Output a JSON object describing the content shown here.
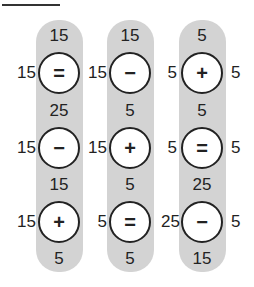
{
  "puzzle": {
    "columns": [
      {
        "rows": [
          {
            "top": "15",
            "left": "15",
            "op": "=",
            "right": "15"
          },
          {
            "top": "25",
            "left": "15",
            "op": "−",
            "right": "15"
          },
          {
            "top": "15",
            "left": "15",
            "op": "+",
            "right": "5"
          }
        ],
        "bottom": "5"
      },
      {
        "rows": [
          {
            "top": "15",
            "left": "15",
            "op": "−",
            "right": "5"
          },
          {
            "top": "5",
            "left": "15",
            "op": "+",
            "right": "5"
          },
          {
            "top": "5",
            "left": "5",
            "op": "=",
            "right": "25"
          }
        ],
        "bottom": "5"
      },
      {
        "rows": [
          {
            "top": "5",
            "left": "5",
            "op": "+",
            "right": "5"
          },
          {
            "top": "5",
            "left": "5",
            "op": "=",
            "right": "5"
          },
          {
            "top": "25",
            "left": "25",
            "op": "−",
            "right": "5"
          }
        ],
        "bottom": "15"
      }
    ]
  }
}
